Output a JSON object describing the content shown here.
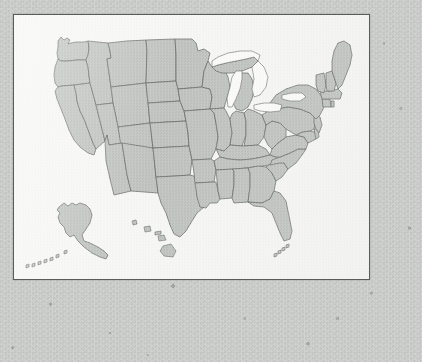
{
  "scene": {
    "kind": "photographed-wall-map",
    "surface": "speckled gray stone wall",
    "colors": {
      "backdrop": "#c9cbc9",
      "backdrop_speck": "#6e7070",
      "poster_paper": "#f6f6f4",
      "poster_frame": "#5a5c5c",
      "state_fill": "#b5b9b5",
      "state_border": "#4e5050",
      "lake_fill": "#fbfbf9"
    }
  },
  "poster": {
    "title": "",
    "frame": {
      "x": 13,
      "y": 14,
      "width": 355,
      "height": 264
    },
    "description": "Blank outline map of the United States, no labels or legend"
  },
  "map": {
    "name": "united-states-outline-map",
    "projection": "conic",
    "has_labels": false,
    "has_legend": false,
    "has_scale_bar": false,
    "has_compass": false,
    "regions": [
      {
        "name": "contiguous-united-states",
        "placement": "main body, center of poster"
      },
      {
        "name": "alaska",
        "placement": "inset lower-left of poster"
      },
      {
        "name": "hawaii",
        "placement": "inset lower-center of poster"
      }
    ],
    "water_bodies": [
      {
        "name": "lake-superior"
      },
      {
        "name": "lake-michigan"
      },
      {
        "name": "lake-huron"
      },
      {
        "name": "lake-erie"
      },
      {
        "name": "lake-ontario"
      }
    ],
    "states": [
      "Washington",
      "Oregon",
      "California",
      "Nevada",
      "Idaho",
      "Montana",
      "Wyoming",
      "Utah",
      "Arizona",
      "Colorado",
      "New Mexico",
      "North Dakota",
      "South Dakota",
      "Nebraska",
      "Kansas",
      "Oklahoma",
      "Texas",
      "Minnesota",
      "Iowa",
      "Missouri",
      "Arkansas",
      "Louisiana",
      "Wisconsin",
      "Illinois",
      "Michigan",
      "Indiana",
      "Ohio",
      "Kentucky",
      "Tennessee",
      "Mississippi",
      "Alabama",
      "Georgia",
      "Florida",
      "South Carolina",
      "North Carolina",
      "Virginia",
      "West Virginia",
      "Maryland",
      "Delaware",
      "Pennsylvania",
      "New Jersey",
      "New York",
      "Connecticut",
      "Rhode Island",
      "Massachusetts",
      "Vermont",
      "New Hampshire",
      "Maine",
      "Alaska",
      "Hawaii"
    ]
  }
}
